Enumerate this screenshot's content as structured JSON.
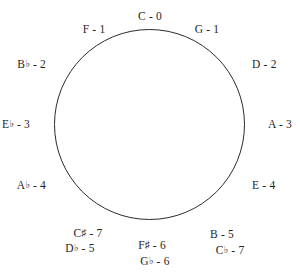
{
  "diagram": {
    "shape": "circle-outline",
    "stroke_color": "#2b2b2b",
    "background_color": "#ffffff",
    "labels": [
      {
        "id": "c",
        "note": "C",
        "accidental": "",
        "separator": "-",
        "value": "0",
        "text": "C - 0",
        "x": 150,
        "y": 10,
        "anchor": "center"
      },
      {
        "id": "g",
        "note": "G",
        "accidental": "",
        "separator": "-",
        "value": "1",
        "text": "G - 1",
        "x": 207,
        "y": 23,
        "anchor": "center"
      },
      {
        "id": "d",
        "note": "D",
        "accidental": "",
        "separator": "-",
        "value": "2",
        "text": "D - 2",
        "x": 252,
        "y": 64,
        "anchor": "west"
      },
      {
        "id": "a",
        "note": "A",
        "accidental": "",
        "separator": "-",
        "value": "3",
        "text": "A - 3",
        "x": 268,
        "y": 124,
        "anchor": "west"
      },
      {
        "id": "e",
        "note": "E",
        "accidental": "",
        "separator": "-",
        "value": "4",
        "text": "E - 4",
        "x": 252,
        "y": 185,
        "anchor": "west"
      },
      {
        "id": "b",
        "note": "B",
        "accidental": "",
        "separator": "-",
        "value": "5",
        "text": "B - 5",
        "x": 222,
        "y": 228,
        "anchor": "center"
      },
      {
        "id": "cflat",
        "note": "C",
        "accidental": "♭",
        "separator": "-",
        "value": "7",
        "text": "C♭ - 7",
        "x": 230,
        "y": 243,
        "anchor": "center"
      },
      {
        "id": "fsharp",
        "note": "F",
        "accidental": "♯",
        "separator": "-",
        "value": "6",
        "text": "F♯ - 6",
        "x": 152,
        "y": 238,
        "anchor": "center"
      },
      {
        "id": "gflat",
        "note": "G",
        "accidental": "♭",
        "separator": "-",
        "value": "6",
        "text": "G♭ - 6",
        "x": 155,
        "y": 254,
        "anchor": "center"
      },
      {
        "id": "csharp",
        "note": "C",
        "accidental": "♯",
        "separator": "-",
        "value": "7",
        "text": "C♯ - 7",
        "x": 88,
        "y": 226,
        "anchor": "center"
      },
      {
        "id": "dflat",
        "note": "D",
        "accidental": "♭",
        "separator": "-",
        "value": "5",
        "text": "D♭ - 5",
        "x": 80,
        "y": 241,
        "anchor": "center"
      },
      {
        "id": "aflat",
        "note": "A",
        "accidental": "♭",
        "separator": "-",
        "value": "4",
        "text": "A♭ - 4",
        "x": 46,
        "y": 185,
        "anchor": "east"
      },
      {
        "id": "eflat",
        "note": "E",
        "accidental": "♭",
        "separator": "-",
        "value": "3",
        "text": "E♭ - 3",
        "x": 30,
        "y": 124,
        "anchor": "east"
      },
      {
        "id": "bflat",
        "note": "B",
        "accidental": "♭",
        "separator": "-",
        "value": "2",
        "text": "B♭ - 2",
        "x": 46,
        "y": 64,
        "anchor": "east"
      },
      {
        "id": "f",
        "note": "F",
        "accidental": "",
        "separator": "-",
        "value": "1",
        "text": "F - 1",
        "x": 94,
        "y": 23,
        "anchor": "center"
      }
    ]
  }
}
